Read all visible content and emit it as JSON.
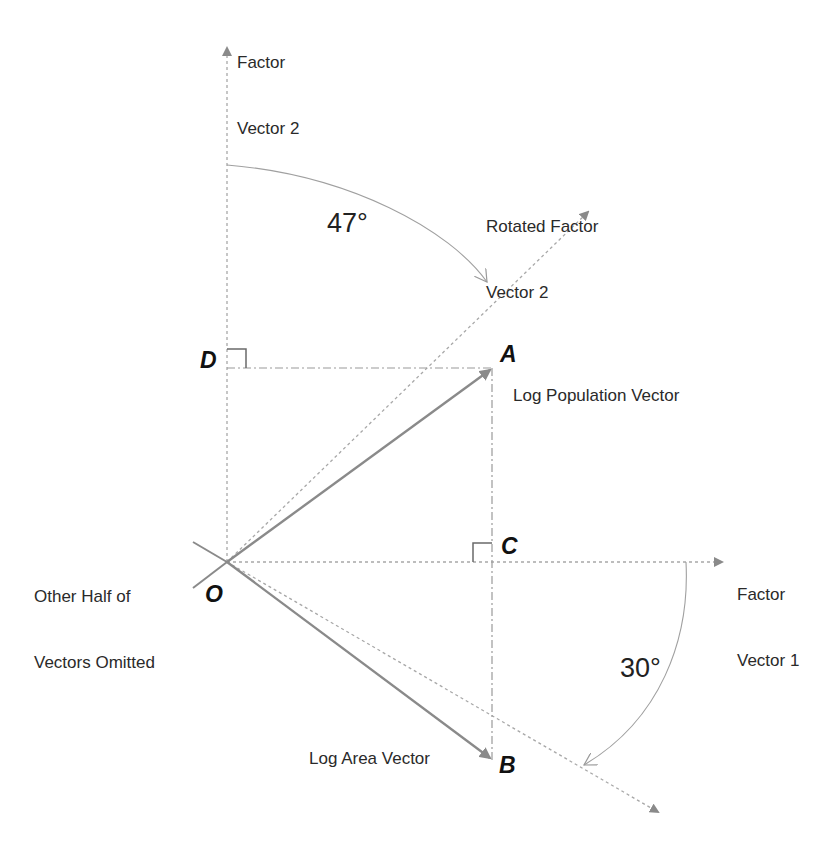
{
  "diagram": {
    "type": "vector-rotation-diagram",
    "axes": {
      "factor_vector_1": {
        "label_line1": "Factor",
        "label_line2": "Vector 1"
      },
      "factor_vector_2": {
        "label_line1": "Factor",
        "label_line2": "Vector 2"
      },
      "rotated_factor_vector_2": {
        "label_line1": "Rotated Factor",
        "label_line2": "Vector 2"
      }
    },
    "vectors": {
      "log_population": {
        "label": "Log Population Vector"
      },
      "log_area": {
        "label": "Log Area Vector"
      }
    },
    "points": {
      "A": "A",
      "B": "B",
      "C": "C",
      "D": "D",
      "O": "O"
    },
    "angles": {
      "rotation_vector2": "47°",
      "rotation_vector1": "30°"
    },
    "note": {
      "line1": "Other Half of",
      "line2": "Vectors Omitted"
    },
    "colors": {
      "line": "#8a8a8a",
      "dotted": "#a8a8a8",
      "text": "#2a2a2a"
    }
  }
}
